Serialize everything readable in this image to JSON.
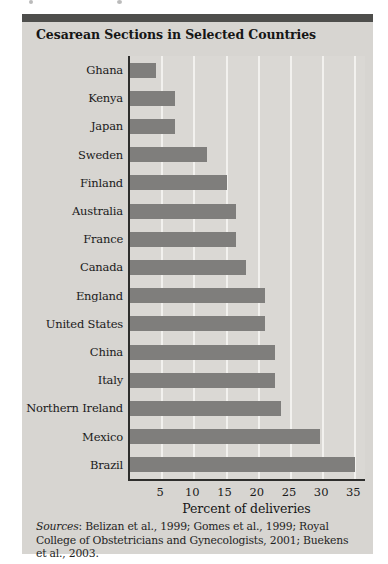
{
  "figure": {
    "source_prefix": "Sources",
    "source_text": ": Belizan et al., 1999; Gomes et al., 1999; Royal College of Obstetricians and Gynecologists, 2001; Buekens et al., 2003."
  },
  "chart_data": {
    "type": "bar",
    "orientation": "horizontal",
    "title": "Cesarean Sections in Selected Countries",
    "xlabel": "Percent of deliveries",
    "categories": [
      "Ghana",
      "Kenya",
      "Japan",
      "Sweden",
      "Finland",
      "Australia",
      "France",
      "Canada",
      "England",
      "United States",
      "China",
      "Italy",
      "Northern Ireland",
      "Mexico",
      "Brazil"
    ],
    "values": [
      4,
      7,
      7,
      12,
      15,
      16.5,
      16.5,
      18,
      21,
      21,
      22.5,
      22.5,
      23.5,
      29.5,
      35
    ],
    "xlim": [
      0,
      36.5
    ],
    "xticks": [
      5,
      10,
      15,
      20,
      25,
      30,
      35
    ],
    "grid": "vertical-white-lines",
    "legend": "none",
    "colors": {
      "bar": "#7f7e7c",
      "panel_background": "#d7d5d1",
      "top_strip": "#4e4e4c",
      "gridline": "#f2f1ee",
      "axis": "#2e2e2c"
    }
  }
}
